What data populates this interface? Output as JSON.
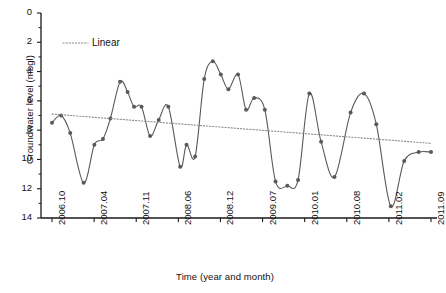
{
  "chart_data": {
    "type": "line",
    "title": "",
    "xlabel": "Time (year and month)",
    "ylabel": "Groundwater level (mbgl)",
    "y_inverted": true,
    "ylim": [
      0,
      14
    ],
    "y_ticks": [
      "0",
      "2",
      "4",
      "6",
      "8",
      "10",
      "12",
      "14"
    ],
    "y_tick_values": [
      0,
      2,
      4,
      6,
      8,
      10,
      12,
      14
    ],
    "x_tick_labels": [
      "2006.10",
      "2007.04",
      "2007.11",
      "2008.06",
      "2008.12",
      "2009.07",
      "2010.01",
      "2010.08",
      "2011.02",
      "2011.09"
    ],
    "grid": false,
    "legend_position": "top-left",
    "legend": [
      {
        "name": "Linear",
        "style": "dotted",
        "color": "#8a8a8a"
      }
    ],
    "series": [
      {
        "name": "Groundwater level",
        "style": "line-with-markers",
        "color": "#595959",
        "marker": "circle",
        "x": [
          2006.13,
          2006.3,
          2006.47,
          2006.72,
          2006.92,
          2007.08,
          2007.22,
          2007.4,
          2007.54,
          2007.66,
          2007.8,
          2007.96,
          2008.12,
          2008.3,
          2008.52,
          2008.64,
          2008.8,
          2008.97,
          2009.13,
          2009.28,
          2009.42,
          2009.6,
          2009.75,
          2009.9,
          2010.1,
          2010.3,
          2010.52,
          2010.72,
          2010.93,
          2011.15,
          2011.4,
          2011.7,
          2011.95,
          2012.18,
          2012.45,
          2012.7,
          2012.97,
          2013.2
        ],
        "values": [
          7.5,
          7.0,
          8.2,
          11.6,
          9.0,
          8.6,
          7.2,
          4.7,
          5.4,
          6.4,
          6.4,
          8.4,
          7.3,
          6.4,
          10.5,
          9.0,
          9.8,
          4.5,
          3.3,
          4.2,
          5.2,
          4.2,
          6.6,
          5.8,
          6.6,
          11.5,
          11.8,
          11.4,
          5.5,
          8.8,
          11.2,
          6.8,
          5.5,
          7.6,
          13.2,
          10.1,
          9.5,
          9.5
        ]
      },
      {
        "name": "Linear",
        "style": "dotted-trend",
        "color": "#8a8a8a",
        "x_start": 2006.13,
        "x_end": 2013.2,
        "y_start": 6.9,
        "y_end": 8.9
      }
    ]
  },
  "axes": {
    "y_title": "Groundwater level (mbgl)",
    "x_title": "Time (year and month)"
  },
  "legend": {
    "linear_label": "Linear"
  },
  "colors": {
    "series_line": "#595959",
    "trend_line": "#8a8a8a",
    "axis": "#1a1a1a",
    "background": "#ffffff"
  }
}
